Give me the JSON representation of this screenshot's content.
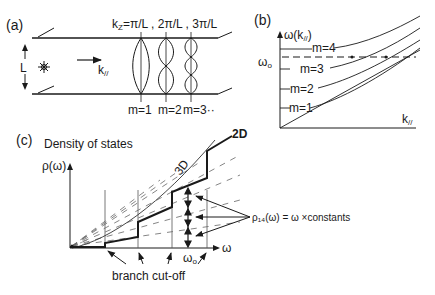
{
  "panel_a": {
    "label": "(a)",
    "height_label": "L",
    "wavevector_label": "k",
    "wavevector_sub": "//",
    "kz_label": "k",
    "kz_sub": "Z",
    "kz_values": "=π/L , 2π/L , 3π/L",
    "modes": [
      "m=1",
      "m=2",
      "m=3··"
    ]
  },
  "panel_b": {
    "label": "(b)",
    "y_axis_label": "ω(k",
    "y_axis_sub": "//",
    "y_axis_close": ")",
    "x_axis_label": "k",
    "x_axis_sub": "//",
    "omega0": "ω",
    "omega0_sub": "o",
    "branches": [
      "m=4",
      "m=3",
      "m=2",
      "m=1"
    ]
  },
  "panel_c": {
    "label": "(c)",
    "title": "Density of states",
    "y_axis_label": "ρ(ω)",
    "x_axis_label": "ω",
    "curve_2d": "2D",
    "curve_3d": "3D",
    "omega0": "ω",
    "omega0_sub": "o",
    "cutoff_label": "branch cut-off",
    "formula": "ρ₁₄(ω)  =  ω ×constants"
  }
}
